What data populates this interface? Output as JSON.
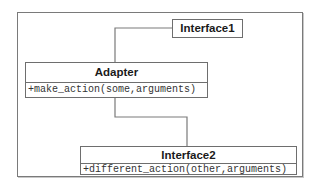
{
  "diagram": {
    "type": "uml-class-diagram",
    "classes": [
      {
        "name": "Interface1",
        "methods": []
      },
      {
        "name": "Adapter",
        "methods": [
          "+make_action(some,arguments)"
        ]
      },
      {
        "name": "Interface2",
        "methods": [
          "+different_action(other,arguments)"
        ]
      }
    ],
    "connections": [
      {
        "from": "Adapter",
        "to": "Interface1"
      },
      {
        "from": "Adapter",
        "to": "Interface2"
      }
    ],
    "colors": {
      "line": "#7a7a7a",
      "border": "#6e6e6e",
      "text": "#1a1a1a"
    }
  }
}
